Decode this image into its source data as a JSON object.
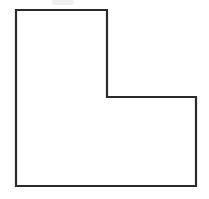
{
  "figure": {
    "name": "l-shaped-polygon",
    "canvas": {
      "width": 209,
      "height": 199,
      "background": "#ffffff"
    },
    "stroke": {
      "color": "#2b2b2b",
      "width": 2.2,
      "linejoin": "miter"
    },
    "fill": "#ffffff",
    "points": "16,10 107,10 107,97 196,97 196,186 16,186",
    "vertices": [
      {
        "label": "top-left",
        "x": 16,
        "y": 10
      },
      {
        "label": "top-right",
        "x": 107,
        "y": 10
      },
      {
        "label": "inner-right-upper",
        "x": 107,
        "y": 97
      },
      {
        "label": "outer-right-upper",
        "x": 196,
        "y": 97
      },
      {
        "label": "bottom-right",
        "x": 196,
        "y": 186
      },
      {
        "label": "bottom-left",
        "x": 16,
        "y": 186
      }
    ],
    "edges": [
      {
        "name": "top-edge",
        "from": "top-left",
        "to": "top-right",
        "length": 91
      },
      {
        "name": "upper-right-edge",
        "from": "top-right",
        "to": "inner-right-upper",
        "length": 87
      },
      {
        "name": "notch-horizontal-edge",
        "from": "inner-right-upper",
        "to": "outer-right-upper",
        "length": 89
      },
      {
        "name": "lower-right-edge",
        "from": "outer-right-upper",
        "to": "bottom-right",
        "length": 89
      },
      {
        "name": "bottom-edge",
        "from": "bottom-right",
        "to": "bottom-left",
        "length": 180
      },
      {
        "name": "left-edge",
        "from": "bottom-left",
        "to": "top-left",
        "length": 176
      }
    ]
  },
  "artifacts": {
    "smudge_label": "scan-smudge",
    "smudge_color": "#e9e9e9"
  }
}
